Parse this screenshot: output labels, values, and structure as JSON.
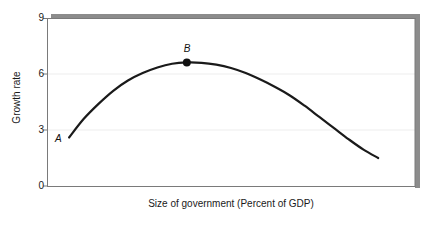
{
  "chart_data": {
    "type": "line",
    "title": "",
    "subtitle": "",
    "xlabel": "Size of government (Percent of GDP)",
    "ylabel": "Growth rate",
    "yticks": [
      "0",
      "3",
      "6",
      "9"
    ],
    "ytick_values": [
      0,
      3,
      6,
      9
    ],
    "xticks": [],
    "ylim": [
      0,
      9
    ],
    "xlim": [
      0,
      100
    ],
    "grid": "horizontal-faint",
    "legend": "none",
    "curve_name": "Armey curve",
    "series": [
      {
        "name": "Growth rate vs size of government",
        "x": [
          6,
          10,
          14,
          18,
          22,
          26,
          30,
          34,
          38,
          42,
          46,
          50,
          54,
          58,
          62,
          66,
          70,
          74,
          78,
          82,
          86,
          90
        ],
        "y": [
          2.6,
          3.6,
          4.4,
          5.1,
          5.65,
          6.05,
          6.35,
          6.55,
          6.62,
          6.6,
          6.5,
          6.32,
          6.05,
          5.7,
          5.3,
          4.85,
          4.3,
          3.7,
          3.1,
          2.5,
          1.95,
          1.5
        ]
      }
    ],
    "annotations": [
      {
        "label": "A",
        "x": 6,
        "y": 2.6,
        "marker": false,
        "note": "lower-left start of curve"
      },
      {
        "label": "B",
        "x": 38,
        "y": 6.62,
        "marker": true,
        "note": "peak of curve, growth-maximizing size of government"
      }
    ],
    "colors": {
      "curve": "#1a1a1a",
      "axis": "#7a7a7a",
      "frame_shadow": "#8c8c8c",
      "gridline": "#ededed",
      "text": "#1a1a1a",
      "background": "#ffffff"
    }
  }
}
